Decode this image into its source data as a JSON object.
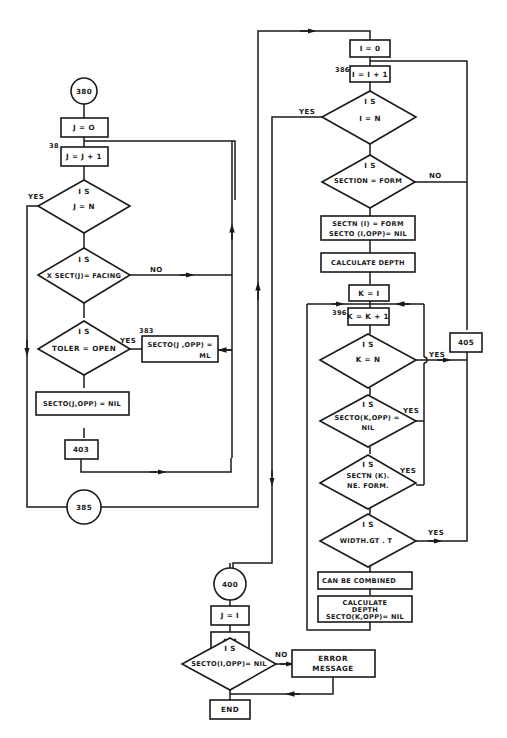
{
  "diagram": {
    "type": "flowchart",
    "connectors": {
      "c380": "380",
      "c385": "385",
      "c400": "400"
    },
    "left_column": {
      "j_init": "J = O",
      "label_38": "38",
      "j_incr": "J = J + 1",
      "dec_j_eq_n": {
        "is": "I S",
        "cond": "J  =  N",
        "yes": "YES"
      },
      "dec_xsect": {
        "is": "I S",
        "cond": "X SECT(J)= FACING",
        "no": "NO"
      },
      "dec_toler": {
        "is": "I S",
        "cond": "TOLER = OPEN",
        "yes": "YES"
      },
      "label_383": "383",
      "box_secto_ml_1": "SECTO(J ,OPP) =",
      "box_secto_ml_2": "ML",
      "box_secto_nil": "SECTO(J,OPP) = NIL",
      "box_403": "403"
    },
    "right_column": {
      "i_init": "I = 0",
      "label_386": "386",
      "i_incr": "I = I + 1",
      "dec_i_eq_n": {
        "is": "I S",
        "cond": "I  =  N",
        "yes": "YES"
      },
      "dec_section": {
        "is": "I S",
        "cond": "SECTION = FORM",
        "no": "NO"
      },
      "box_sectn_1": "SECTN (I) = FORM",
      "box_sectn_2": "SECTO (I,OPP)= NIL",
      "box_calc_depth": "CALCULATE  DEPTH",
      "k_init": "K = I",
      "label_396": "396",
      "k_incr": "K = K + 1",
      "dec_k_eq_n": {
        "is": "I S",
        "cond": "K  =  N",
        "yes": "YES"
      },
      "dec_secto_k": {
        "is": "I S",
        "cond1": "SECTO(K,OPP) =",
        "cond2": "NIL",
        "yes": "YES"
      },
      "dec_sectn_k": {
        "is": "I S",
        "cond1": "SECTN (K).",
        "cond2": "NE. FORM.",
        "yes": "YES"
      },
      "dec_width": {
        "is": "I S",
        "cond": "WIDTH.GT . T",
        "yes": "YES"
      },
      "box_405": "405",
      "box_combined": "CAN BE COMBINED",
      "box_calc2_1": "CALCULATE",
      "box_calc2_2": "DEPTH",
      "box_calc2_3": "SECTO(K,OPP)= NIL"
    },
    "bottom": {
      "j_one": "J = I",
      "box_401": "401",
      "dec_secto_i": {
        "is": "I S",
        "cond": "SECTO(I,OPP)= NIL",
        "no": "NO"
      },
      "box_error_1": "ERROR",
      "box_error_2": "MESSAGE",
      "box_end": "END"
    },
    "colors": {
      "ink": "#1a1a1a",
      "paper": "#ffffff"
    }
  }
}
